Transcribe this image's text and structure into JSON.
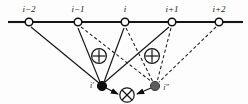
{
  "figure": {
    "type": "graph-diagram",
    "background_color": "#fdfdfd",
    "ink_color": "#141414",
    "width": 248,
    "height": 104
  },
  "top_nodes": [
    {
      "label": "i−2",
      "x": 29,
      "y": 22,
      "style": "open-circle"
    },
    {
      "label": "i−1",
      "x": 78,
      "y": 22,
      "style": "open-circle"
    },
    {
      "label": "i",
      "x": 125,
      "y": 22,
      "style": "open-circle"
    },
    {
      "label": "i+1",
      "x": 172,
      "y": 22,
      "style": "open-circle"
    },
    {
      "label": "i+2",
      "x": 219,
      "y": 22,
      "style": "open-circle"
    }
  ],
  "bottom_nodes": [
    {
      "label": "i′",
      "x": 102,
      "y": 86,
      "style": "filled-black"
    },
    {
      "label": "i″",
      "x": 155,
      "y": 86,
      "style": "filled-gray"
    }
  ],
  "operators": [
    {
      "symbol": "⊕",
      "name": "plus-circle-left",
      "x": 99,
      "y": 56
    },
    {
      "symbol": "⊕",
      "name": "plus-circle-right",
      "x": 152,
      "y": 56
    },
    {
      "symbol": "⊗",
      "name": "times-circle",
      "x": 127,
      "y": 95
    }
  ],
  "edges": {
    "solid_to_left_node": [
      "i−2",
      "i−1",
      "i",
      "i+1"
    ],
    "dashed_to_right_node": [
      "i−1",
      "i",
      "i+1",
      "i+2"
    ],
    "arrows_into_times_circle": [
      "i′",
      "i″"
    ]
  },
  "legend": {
    "solid_meaning": "solid edge",
    "dashed_meaning": "dashed edge"
  }
}
